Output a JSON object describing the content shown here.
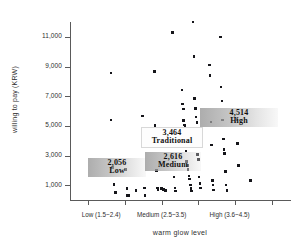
{
  "chart_data": {
    "type": "scatter",
    "title": "",
    "xlabel": "warm glow  level",
    "ylabel": "willing to pay (KRW)",
    "ylim": [
      0,
      12000
    ],
    "yticks": [
      "1,000",
      "3,000",
      "5,000",
      "7,000",
      "9,000",
      "11,000"
    ],
    "ytick_values": [
      1000,
      3000,
      5000,
      7000,
      9000,
      11000
    ],
    "xlim": [
      0.5,
      6.5
    ],
    "xtick_positions": [
      1,
      2,
      3,
      4,
      5,
      6
    ],
    "xticklabels": [
      "Low (1.5~2.4)",
      "Medium (2.5~3.5)",
      "High (3.6~4.5)"
    ],
    "grid": false,
    "legend": "none",
    "annotations": [
      {
        "amount": "2,056",
        "category": "Low",
        "style": "shaded"
      },
      {
        "amount": "2,616",
        "category": "Medium",
        "style": "shaded"
      },
      {
        "amount": "3,464",
        "category": "Traditional",
        "style": "plain"
      },
      {
        "amount": "4,514",
        "category": "High",
        "style": "shaded"
      }
    ],
    "point_color": "#15151a",
    "points": [
      {
        "x": 1.62,
        "y": 8560
      },
      {
        "x": 1.62,
        "y": 5380
      },
      {
        "x": 1.66,
        "y": 2180
      },
      {
        "x": 1.7,
        "y": 1060
      },
      {
        "x": 1.74,
        "y": 520
      },
      {
        "x": 2.02,
        "y": 2040
      },
      {
        "x": 2.05,
        "y": 760
      },
      {
        "x": 2.07,
        "y": 320
      },
      {
        "x": 2.1,
        "y": 300
      },
      {
        "x": 2.3,
        "y": 640
      },
      {
        "x": 2.47,
        "y": 5650
      },
      {
        "x": 2.49,
        "y": 4450
      },
      {
        "x": 2.5,
        "y": 3920
      },
      {
        "x": 2.52,
        "y": 3700
      },
      {
        "x": 2.53,
        "y": 820
      },
      {
        "x": 2.55,
        "y": 320
      },
      {
        "x": 2.8,
        "y": 8660
      },
      {
        "x": 2.82,
        "y": 5010
      },
      {
        "x": 2.84,
        "y": 3880
      },
      {
        "x": 2.86,
        "y": 1980
      },
      {
        "x": 2.88,
        "y": 800
      },
      {
        "x": 2.9,
        "y": 700
      },
      {
        "x": 3.0,
        "y": 760
      },
      {
        "x": 3.05,
        "y": 700
      },
      {
        "x": 3.1,
        "y": 660
      },
      {
        "x": 3.3,
        "y": 11300
      },
      {
        "x": 3.32,
        "y": 3860
      },
      {
        "x": 3.34,
        "y": 1560
      },
      {
        "x": 3.36,
        "y": 800
      },
      {
        "x": 3.38,
        "y": 620
      },
      {
        "x": 3.55,
        "y": 7420
      },
      {
        "x": 3.57,
        "y": 6460
      },
      {
        "x": 3.59,
        "y": 6130
      },
      {
        "x": 3.6,
        "y": 5360
      },
      {
        "x": 3.62,
        "y": 5060
      },
      {
        "x": 3.64,
        "y": 4980
      },
      {
        "x": 3.66,
        "y": 3290
      },
      {
        "x": 3.68,
        "y": 2600
      },
      {
        "x": 3.7,
        "y": 2340
      },
      {
        "x": 3.72,
        "y": 2050
      },
      {
        "x": 3.74,
        "y": 1630
      },
      {
        "x": 3.76,
        "y": 1420
      },
      {
        "x": 3.78,
        "y": 1020
      },
      {
        "x": 3.8,
        "y": 780
      },
      {
        "x": 3.82,
        "y": 620
      },
      {
        "x": 3.86,
        "y": 12000
      },
      {
        "x": 3.88,
        "y": 9680
      },
      {
        "x": 3.9,
        "y": 6840
      },
      {
        "x": 3.92,
        "y": 6160
      },
      {
        "x": 3.94,
        "y": 5600
      },
      {
        "x": 3.96,
        "y": 5230
      },
      {
        "x": 3.98,
        "y": 3060
      },
      {
        "x": 4.0,
        "y": 2750
      },
      {
        "x": 4.02,
        "y": 1560
      },
      {
        "x": 4.04,
        "y": 1120
      },
      {
        "x": 4.06,
        "y": 800
      },
      {
        "x": 4.3,
        "y": 9100
      },
      {
        "x": 4.32,
        "y": 8380
      },
      {
        "x": 4.34,
        "y": 5270
      },
      {
        "x": 4.36,
        "y": 3700
      },
      {
        "x": 4.38,
        "y": 1320
      },
      {
        "x": 4.4,
        "y": 1010
      },
      {
        "x": 4.42,
        "y": 680
      },
      {
        "x": 4.6,
        "y": 10980
      },
      {
        "x": 4.62,
        "y": 7620
      },
      {
        "x": 4.64,
        "y": 6680
      },
      {
        "x": 4.66,
        "y": 5400
      },
      {
        "x": 4.68,
        "y": 4120
      },
      {
        "x": 4.7,
        "y": 3400
      },
      {
        "x": 4.72,
        "y": 3150
      },
      {
        "x": 4.74,
        "y": 1940
      },
      {
        "x": 4.76,
        "y": 1020
      },
      {
        "x": 4.78,
        "y": 640
      },
      {
        "x": 5.05,
        "y": 5420
      },
      {
        "x": 5.07,
        "y": 3820
      },
      {
        "x": 5.1,
        "y": 2340
      },
      {
        "x": 5.42,
        "y": 1320
      }
    ]
  }
}
